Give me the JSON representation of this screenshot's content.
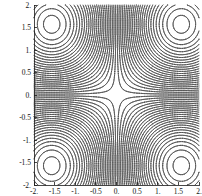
{
  "figure": {
    "background": "#ffffff",
    "title": ""
  },
  "chart_data": {
    "type": "contour",
    "title": "",
    "xlabel": "",
    "ylabel": "",
    "function": "sin(x)*sin(y)",
    "x_range": [
      -2,
      2
    ],
    "y_range": [
      -2,
      2
    ],
    "z_range": [
      -1,
      1
    ],
    "grid": false,
    "legend": "none",
    "contour_levels": {
      "start": -0.98,
      "step": 0.04,
      "count": 50
    },
    "saddle_point": [
      0,
      0
    ],
    "extrema": [
      [
        -1.5708,
        1.5708
      ],
      [
        1.5708,
        1.5708
      ],
      [
        -1.5708,
        -1.5708
      ],
      [
        1.5708,
        -1.5708
      ]
    ],
    "x_tick_values": [
      -2,
      -1.5,
      -1,
      -0.5,
      0,
      0.5,
      1,
      1.5,
      2
    ],
    "x_tick_labels": [
      "-2.",
      "-1.5",
      "-1.",
      "-0.5",
      "0.",
      "0.5",
      "1.",
      "1.5",
      "2."
    ],
    "y_tick_values": [
      2,
      1.5,
      1,
      0.5,
      0,
      -0.5,
      -1,
      -1.5,
      -2
    ],
    "y_tick_labels": [
      "2.",
      "1.5",
      "1.",
      "0.5",
      "0.",
      "-0.5",
      "-1.",
      "-1.5",
      "-2."
    ],
    "line_color": "#474747",
    "line_width": 0.65,
    "axis_color": "#1a1a1a",
    "tick_label_color": "#111111"
  }
}
